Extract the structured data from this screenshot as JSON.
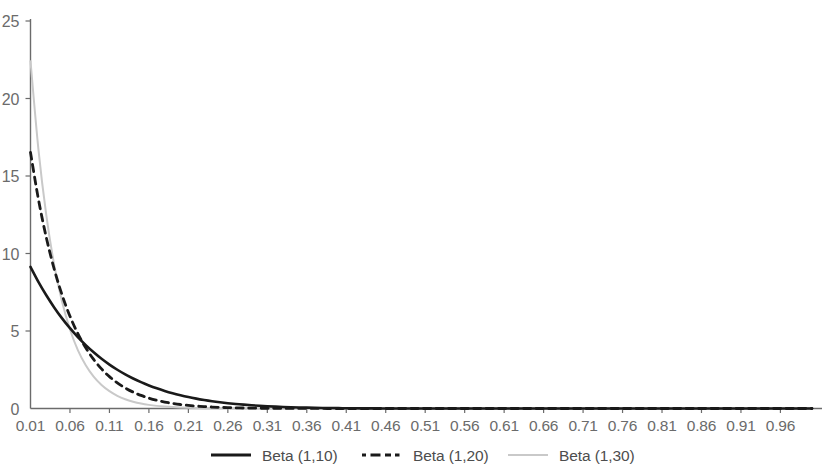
{
  "chart_data": {
    "type": "line",
    "title": "",
    "subtitle": "",
    "xlabel": "",
    "ylabel": "",
    "xlim": [
      0.01,
      1.0
    ],
    "ylim": [
      0,
      25
    ],
    "grid": false,
    "legend_position": "bottom",
    "xticks": [
      "0.01",
      "0.06",
      "0.11",
      "0.16",
      "0.21",
      "0.26",
      "0.31",
      "0.36",
      "0.41",
      "0.46",
      "0.51",
      "0.56",
      "0.61",
      "0.66",
      "0.71",
      "0.76",
      "0.81",
      "0.86",
      "0.91",
      "0.96"
    ],
    "xtick_values": [
      0.01,
      0.06,
      0.11,
      0.16,
      0.21,
      0.26,
      0.31,
      0.36,
      0.41,
      0.46,
      0.51,
      0.56,
      0.61,
      0.66,
      0.71,
      0.76,
      0.81,
      0.86,
      0.91,
      0.96
    ],
    "yticks": [
      "0",
      "5",
      "10",
      "15",
      "20",
      "25"
    ],
    "ytick_values": [
      0,
      5,
      10,
      15,
      20,
      25
    ],
    "x": [
      0.01,
      0.02,
      0.03,
      0.04,
      0.05,
      0.06,
      0.07,
      0.08,
      0.09,
      0.1,
      0.11,
      0.12,
      0.13,
      0.14,
      0.15,
      0.16,
      0.17,
      0.18,
      0.19,
      0.2,
      0.21,
      0.22,
      0.23,
      0.24,
      0.25,
      0.26,
      0.27,
      0.28,
      0.29,
      0.3,
      0.31,
      0.32,
      0.33,
      0.34,
      0.35,
      0.36,
      0.37,
      0.38,
      0.39,
      0.4,
      0.41,
      0.42,
      0.43,
      0.44,
      0.45,
      0.46,
      0.47,
      0.48,
      0.49,
      0.5,
      0.52,
      0.54,
      0.56,
      0.58,
      0.6,
      0.62,
      0.64,
      0.66,
      0.68,
      0.7,
      0.72,
      0.74,
      0.76,
      0.78,
      0.8,
      0.82,
      0.84,
      0.86,
      0.88,
      0.9,
      0.92,
      0.94,
      0.96,
      0.98,
      1.0
    ],
    "series": [
      {
        "name": "Beta (1,10)",
        "color": "#1a1a1a",
        "style": "solid",
        "width": 2.6,
        "values": [
          9.135,
          8.171,
          7.303,
          6.522,
          5.814,
          5.18,
          4.605,
          4.088,
          3.624,
          3.205,
          2.833,
          2.499,
          2.201,
          1.935,
          1.698,
          1.487,
          1.3,
          1.133,
          0.985,
          0.855,
          0.74,
          0.639,
          0.55,
          0.472,
          0.404,
          0.344,
          0.292,
          0.247,
          0.208,
          0.175,
          0.146,
          0.121,
          0.1,
          0.082,
          0.067,
          0.054,
          0.044,
          0.035,
          0.028,
          0.022,
          0.017,
          0.013,
          0.01,
          0.008,
          0.006,
          0.004,
          0.003,
          0.002,
          0.002,
          0.001,
          0.001,
          0.0,
          0.0,
          0.0,
          0.0,
          0.0,
          0.0,
          0.0,
          0.0,
          0.0,
          0.0,
          0.0,
          0.0,
          0.0,
          0.0,
          0.0,
          0.0,
          0.0,
          0.0,
          0.0,
          0.0,
          0.0,
          0.0,
          0.0,
          0.0
        ]
      },
      {
        "name": "Beta (1,20)",
        "color": "#1a1a1a",
        "style": "dashed",
        "width": 2.8,
        "values": [
          16.523,
          13.51,
          11.035,
          9.0,
          7.327,
          5.955,
          4.832,
          3.914,
          3.165,
          2.554,
          2.057,
          1.652,
          1.324,
          1.058,
          0.843,
          0.669,
          0.53,
          0.418,
          0.329,
          0.258,
          0.202,
          0.157,
          0.122,
          0.094,
          0.072,
          0.055,
          0.042,
          0.032,
          0.024,
          0.018,
          0.014,
          0.01,
          0.008,
          0.006,
          0.004,
          0.003,
          0.002,
          0.002,
          0.001,
          0.001,
          0.001,
          0.0,
          0.0,
          0.0,
          0.0,
          0.0,
          0.0,
          0.0,
          0.0,
          0.0,
          0.0,
          0.0,
          0.0,
          0.0,
          0.0,
          0.0,
          0.0,
          0.0,
          0.0,
          0.0,
          0.0,
          0.0,
          0.0,
          0.0,
          0.0,
          0.0,
          0.0,
          0.0,
          0.0,
          0.0,
          0.0,
          0.0,
          0.0,
          0.0,
          0.0
        ]
      },
      {
        "name": "Beta (1,30)",
        "color": "#c9c9c9",
        "style": "solid",
        "width": 2.0,
        "values": [
          22.41,
          16.74,
          12.47,
          9.27,
          6.88,
          5.1,
          3.77,
          2.79,
          2.06,
          1.52,
          1.12,
          0.82,
          0.6,
          0.44,
          0.32,
          0.234,
          0.17,
          0.124,
          0.09,
          0.065,
          0.047,
          0.034,
          0.024,
          0.017,
          0.012,
          0.009,
          0.006,
          0.004,
          0.003,
          0.002,
          0.002,
          0.001,
          0.001,
          0.001,
          0.0,
          0.0,
          0.0,
          0.0,
          0.0,
          0.0,
          0.0,
          0.0,
          0.0,
          0.0,
          0.0,
          0.0,
          0.0,
          0.0,
          0.0,
          0.0,
          0.0,
          0.0,
          0.0,
          0.0,
          0.0,
          0.0,
          0.0,
          0.0,
          0.0,
          0.0,
          0.0,
          0.0,
          0.0,
          0.0,
          0.0,
          0.0,
          0.0,
          0.0,
          0.0,
          0.0,
          0.0,
          0.0,
          0.0,
          0.0,
          0.0
        ]
      }
    ],
    "legend": [
      {
        "label": "Beta (1,10)",
        "color": "#1a1a1a",
        "style": "solid"
      },
      {
        "label": "Beta (1,20)",
        "color": "#1a1a1a",
        "style": "dashed"
      },
      {
        "label": "Beta (1,30)",
        "color": "#c9c9c9",
        "style": "solid"
      }
    ]
  },
  "axis": {
    "line_color": "#6b6b6b",
    "tick_color": "#6b6b6b"
  }
}
